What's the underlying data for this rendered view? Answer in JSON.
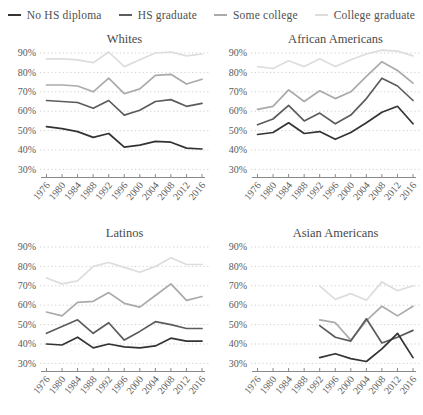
{
  "legend": {
    "items": [
      {
        "label": "No HS diploma",
        "color": "#333333"
      },
      {
        "label": "HS graduate",
        "color": "#5c5c5c"
      },
      {
        "label": "Some college",
        "color": "#aaaaaa"
      },
      {
        "label": "College graduate",
        "color": "#dddddd"
      }
    ]
  },
  "axes": {
    "y_tick_labels": [
      "90%",
      "80%",
      "70%",
      "60%",
      "50%",
      "40%",
      "30%"
    ],
    "x_tick_labels": [
      "1976",
      "1980",
      "1984",
      "1988",
      "1992",
      "1996",
      "2000",
      "2004",
      "2008",
      "2012",
      "2016"
    ],
    "grid": "horizontal-dotted",
    "gridline_color": "#c9c9c9",
    "axis_color": "#8a8a8a"
  },
  "chart_data": [
    {
      "type": "line",
      "title": "Whites",
      "y_axis": {
        "min": 30,
        "max": 90,
        "step": 10,
        "format": "percent"
      },
      "data_years": [
        "1976",
        "1980",
        "1984",
        "1988",
        "1992",
        "1996",
        "2000",
        "2004",
        "2008",
        "2012",
        "2016"
      ],
      "series": [
        {
          "name": "No HS diploma",
          "values": [
            52,
            51,
            49.5,
            46.5,
            48.5,
            41.5,
            42.5,
            44.5,
            44,
            41,
            40.5
          ]
        },
        {
          "name": "HS graduate",
          "values": [
            65.5,
            65,
            64.5,
            61.5,
            65.5,
            58,
            60.5,
            65,
            66,
            62.5,
            64
          ]
        },
        {
          "name": "Some college",
          "values": [
            73.5,
            73.5,
            73,
            70,
            77,
            69,
            71.5,
            78.5,
            79,
            74,
            76.5
          ]
        },
        {
          "name": "College graduate",
          "values": [
            87,
            87,
            86.5,
            85,
            90.5,
            83,
            86.5,
            90,
            90.5,
            88.5,
            89.5
          ]
        }
      ]
    },
    {
      "type": "line",
      "title": "African Americans",
      "y_axis": {
        "min": 30,
        "max": 90,
        "step": 10,
        "format": "percent"
      },
      "data_years": [
        "1976",
        "1980",
        "1984",
        "1988",
        "1992",
        "1996",
        "2000",
        "2004",
        "2008",
        "2012",
        "2016"
      ],
      "series": [
        {
          "name": "No HS diploma",
          "values": [
            48,
            49,
            54,
            48.5,
            49.5,
            45.5,
            49,
            54,
            59.5,
            62.5,
            53.5
          ]
        },
        {
          "name": "HS graduate",
          "values": [
            53,
            56,
            63,
            55,
            59,
            53.5,
            58,
            66.5,
            77,
            73,
            65.5
          ]
        },
        {
          "name": "Some college",
          "values": [
            61,
            62.5,
            71,
            65,
            70.5,
            66.5,
            70,
            78,
            85.5,
            81,
            74.5
          ]
        },
        {
          "name": "College graduate",
          "values": [
            83,
            82,
            86,
            83,
            87,
            83,
            86.5,
            89.5,
            91.5,
            91,
            88.5
          ]
        }
      ]
    },
    {
      "type": "line",
      "title": "Latinos",
      "y_axis": {
        "min": 30,
        "max": 90,
        "step": 10,
        "format": "percent"
      },
      "data_years": [
        "1976",
        "1980",
        "1984",
        "1988",
        "1992",
        "1996",
        "2000",
        "2004",
        "2008",
        "2012",
        "2016"
      ],
      "series": [
        {
          "name": "No HS diploma",
          "values": [
            40,
            39.5,
            43.5,
            38,
            40,
            38.5,
            38,
            39,
            43,
            41.5,
            41.5
          ]
        },
        {
          "name": "HS graduate",
          "values": [
            45.5,
            49,
            52.5,
            45.5,
            51,
            42,
            46.5,
            51.5,
            50,
            48,
            48
          ]
        },
        {
          "name": "Some college",
          "values": [
            56.5,
            54.5,
            61.5,
            62,
            66.5,
            61,
            59,
            65,
            71,
            62.5,
            64.5
          ]
        },
        {
          "name": "College graduate",
          "values": [
            74,
            71,
            72.5,
            80,
            82,
            79.5,
            77,
            80,
            84.5,
            81,
            81
          ]
        }
      ]
    },
    {
      "type": "line",
      "title": "Asian Americans",
      "y_axis": {
        "min": 30,
        "max": 90,
        "step": 10,
        "format": "percent"
      },
      "data_years": [
        "1992",
        "1996",
        "2000",
        "2004",
        "2008",
        "2012",
        "2016"
      ],
      "series": [
        {
          "name": "No HS diploma",
          "values": [
            33,
            35,
            32.5,
            31,
            37.5,
            45.5,
            33
          ]
        },
        {
          "name": "HS graduate",
          "values": [
            49.5,
            43.5,
            41.5,
            53,
            40.5,
            43.5,
            47
          ]
        },
        {
          "name": "Some college",
          "values": [
            52.5,
            51,
            42,
            52,
            59.5,
            54.5,
            59.5
          ]
        },
        {
          "name": "College graduate",
          "values": [
            70,
            63,
            66,
            62.5,
            72,
            67.5,
            70
          ]
        }
      ]
    }
  ]
}
